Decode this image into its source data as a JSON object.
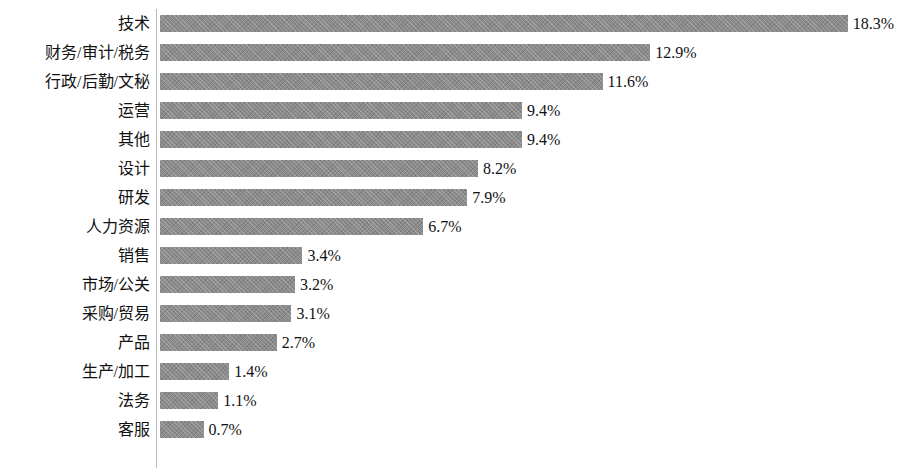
{
  "chart": {
    "title": "",
    "value_suffix": "%"
  },
  "chart_data": {
    "type": "bar",
    "orientation": "horizontal",
    "title": "",
    "subtitle": "",
    "xlabel": "",
    "ylabel": "",
    "grid": false,
    "legend": null,
    "axis_note": "no x tick labels rendered; bars start at left category axis",
    "categories": [
      "技术",
      "财务/审计/税务",
      "行政/后勤/文秘",
      "运营",
      "其他",
      "设计",
      "研发",
      "人力资源",
      "销售",
      "市场/公关",
      "采购/贸易",
      "产品",
      "生产/加工",
      "法务",
      "客服"
    ],
    "values": [
      18.3,
      12.9,
      11.6,
      9.4,
      9.4,
      8.2,
      7.9,
      6.7,
      3.4,
      3.2,
      3.1,
      2.7,
      1.4,
      1.1,
      0.7
    ],
    "value_labels": [
      "18.3%",
      "12.9%",
      "11.6%",
      "9.4%",
      "9.4%",
      "8.2%",
      "7.9%",
      "6.7%",
      "3.4%",
      "3.2%",
      "3.1%",
      "2.7%",
      "1.4%",
      "1.1%",
      "0.7%"
    ],
    "ylim": [
      0,
      19
    ],
    "bar_color": "#8b8b8b",
    "background_color": "#ffffff"
  },
  "render": {
    "bar_px_offset": 18,
    "bar_px_per_unit": 36.6,
    "bar_origin_x": 160,
    "row_pitch": 29,
    "row_top": 6
  }
}
